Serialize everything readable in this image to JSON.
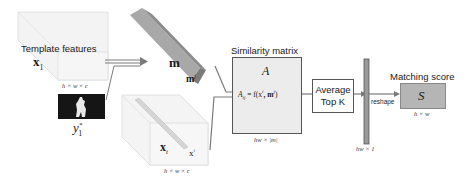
{
  "template": {
    "title": "Template features",
    "symbol": "x",
    "subscript": "1",
    "dims": "h × w × c"
  },
  "mask": {
    "symbol": "y",
    "subscript": "1",
    "superscript": "*"
  },
  "memory": {
    "symbol": "m",
    "item_symbol": "m",
    "item_superscript": "j"
  },
  "test": {
    "symbol": "x",
    "subscript": "t",
    "item_symbol": "x",
    "item_superscript": "i",
    "item_subscript": "t",
    "dims": "h × w × c"
  },
  "similarity": {
    "title": "Similarity matrix",
    "symbol": "A",
    "formula": "A",
    "formula_sub": "ij",
    "formula_rhs": " = f(x",
    "formula_x_sup": "i",
    "formula_x_sub": "t",
    "formula_m": ", m",
    "formula_m_sup": "j",
    "formula_close": ")",
    "dims": "hw × |m|"
  },
  "topk": {
    "line1": "Average",
    "line2": "Top K"
  },
  "vector": {
    "dims": "hw × 1",
    "reshape_label": "reshape"
  },
  "score": {
    "title": "Matching score",
    "symbol": "S",
    "dims": "h × w"
  },
  "colors": {
    "arrow": "#7a7a7a",
    "box_fill": "#ececec",
    "bar_fill": "#9a9a9a",
    "score_fill": "#b5b5b5",
    "memory_fill": "#a8a8a8",
    "parallelogram_fill": "#f3f3f3"
  }
}
